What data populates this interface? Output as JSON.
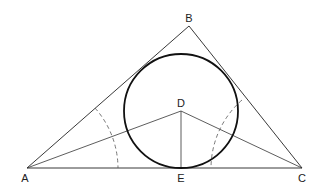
{
  "diagram": {
    "points": {
      "A": {
        "label": "A",
        "x": 27,
        "y": 168
      },
      "B": {
        "label": "B",
        "x": 189,
        "y": 26
      },
      "C": {
        "label": "C",
        "x": 302,
        "y": 168
      },
      "D": {
        "label": "D",
        "x": 181,
        "y": 111
      },
      "E": {
        "label": "E",
        "x": 181,
        "y": 168
      }
    },
    "circle": {
      "center": "D",
      "radius": 57
    },
    "segments": [
      {
        "from": "A",
        "to": "B",
        "style": "thin"
      },
      {
        "from": "B",
        "to": "C",
        "style": "thin"
      },
      {
        "from": "A",
        "to": "C",
        "style": "thin"
      },
      {
        "from": "A",
        "to": "D",
        "style": "thin"
      },
      {
        "from": "C",
        "to": "D",
        "style": "thin"
      },
      {
        "from": "D",
        "to": "E",
        "style": "thin"
      }
    ],
    "arcs": [
      {
        "center": "A",
        "radius": 91,
        "style": "dashed",
        "note": "angle bisector construction arc at A"
      },
      {
        "center": "C",
        "radius": 91,
        "style": "dashed",
        "note": "angle bisector construction arc at C"
      }
    ],
    "colors": {
      "stroke": "#222222",
      "background": "#ffffff"
    }
  }
}
